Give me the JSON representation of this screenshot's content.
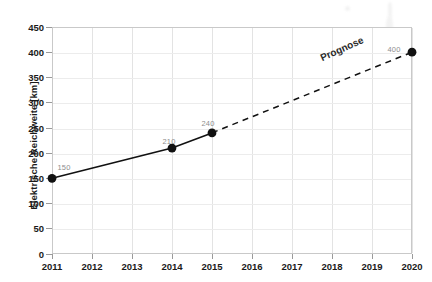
{
  "chart_data": {
    "type": "line",
    "title": "",
    "subtitle": "",
    "xlabel": "",
    "ylabel": "Elektrische Reichweite [km]",
    "x": [
      2011,
      2014,
      2015,
      2020
    ],
    "x_tick_labels": [
      "2011",
      "2012",
      "2013",
      "2014",
      "2015",
      "2016",
      "2017",
      "2018",
      "2019",
      "2020"
    ],
    "y_tick_labels": [
      "0",
      "50",
      "100",
      "150",
      "200",
      "250",
      "300",
      "350",
      "400",
      "450"
    ],
    "xlim": [
      2011,
      2020
    ],
    "ylim": [
      0,
      450
    ],
    "grid": true,
    "legend": "none",
    "series": [
      {
        "name": "Ist",
        "style": "solid",
        "color": "#111111",
        "points": [
          {
            "x": 2011,
            "y": 150,
            "label": "150"
          },
          {
            "x": 2014,
            "y": 210,
            "label": "210"
          },
          {
            "x": 2015,
            "y": 240,
            "label": "240"
          }
        ]
      },
      {
        "name": "Prognose",
        "style": "dashed",
        "color": "#111111",
        "points": [
          {
            "x": 2015,
            "y": 240,
            "label": ""
          },
          {
            "x": 2020,
            "y": 400,
            "label": "400"
          }
        ]
      }
    ],
    "annotations": [
      {
        "text": "Prognose",
        "x": 2018.1,
        "y": 330,
        "rotation": -24
      }
    ]
  },
  "axes": {
    "y_title": "Elektrische Reichweite [km]",
    "y_ticks": [
      {
        "value": 450,
        "label": "450"
      },
      {
        "value": 400,
        "label": "400"
      },
      {
        "value": 350,
        "label": "350"
      },
      {
        "value": 300,
        "label": "300"
      },
      {
        "value": 250,
        "label": "250"
      },
      {
        "value": 200,
        "label": "200"
      },
      {
        "value": 150,
        "label": "150"
      },
      {
        "value": 100,
        "label": "100"
      },
      {
        "value": 50,
        "label": "50"
      },
      {
        "value": 0,
        "label": "0"
      }
    ],
    "x_ticks": [
      {
        "value": 2011,
        "label": "2011"
      },
      {
        "value": 2012,
        "label": "2012"
      },
      {
        "value": 2013,
        "label": "2013"
      },
      {
        "value": 2014,
        "label": "2014"
      },
      {
        "value": 2015,
        "label": "2015"
      },
      {
        "value": 2016,
        "label": "2016"
      },
      {
        "value": 2017,
        "label": "2017"
      },
      {
        "value": 2018,
        "label": "2018"
      },
      {
        "value": 2019,
        "label": "2019"
      },
      {
        "value": 2020,
        "label": "2020"
      }
    ]
  },
  "annotation": {
    "prognose": "Prognose"
  },
  "point_labels": {
    "p2011": "150",
    "p2014": "210",
    "p2015": "240",
    "p2020": "400"
  },
  "colors": {
    "series": "#111111",
    "grid": "#e3e3e3",
    "frame": "#c9c9c9",
    "label_text": "#1a1a1a",
    "point_label_text": "#8e8e8e",
    "background": "#ffffff"
  }
}
